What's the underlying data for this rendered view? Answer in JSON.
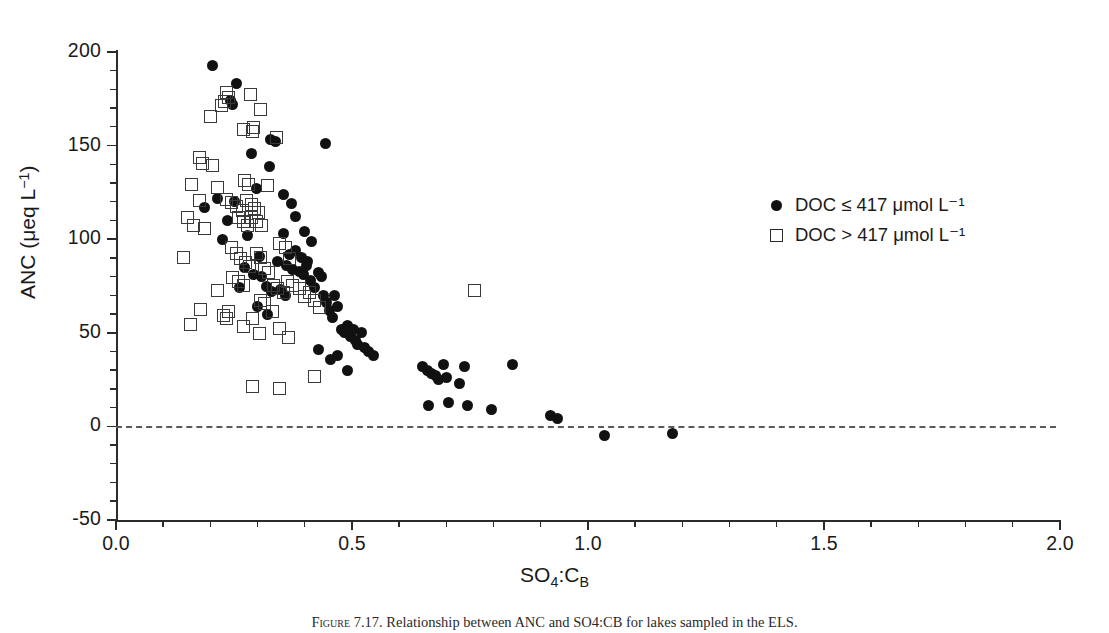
{
  "figure": {
    "caption_label": "Figure 7.17.",
    "caption_text": "Relationship between ANC and SO4:CB for lakes sampled in the ELS."
  },
  "axes": {
    "x": {
      "title_main": "SO",
      "title_sub": "4",
      "title_mid": ":C",
      "title_sub2": "B",
      "min": 0.0,
      "max": 2.0,
      "major_ticks": [
        0.0,
        0.5,
        1.0,
        1.5,
        2.0
      ],
      "tick_labels": [
        "0.0",
        "0.5",
        "1.0",
        "1.5",
        "2.0"
      ],
      "minor_step": 0.1
    },
    "y": {
      "title_main": "ANC (",
      "title_mu": "μ",
      "title_unit": "eq L",
      "title_sup": "−1",
      "title_end": ")",
      "min": -50,
      "max": 200,
      "major_ticks": [
        -50,
        0,
        50,
        100,
        150,
        200
      ],
      "tick_labels": [
        "-50",
        "0",
        "50",
        "100",
        "150",
        "200"
      ],
      "minor_step": 10
    }
  },
  "reference_line": {
    "value": 0,
    "style": "dashed"
  },
  "legend": {
    "items": [
      {
        "marker": "filled-circle",
        "text": "DOC ≤ 417 μmol L⁻¹"
      },
      {
        "marker": "open-square",
        "text": "DOC > 417 μmol L⁻¹"
      }
    ]
  },
  "chart_data": {
    "type": "scatter",
    "title": "Relationship between ANC and SO4:CB for lakes sampled in the ELS",
    "xlabel": "SO4:CB",
    "ylabel": "ANC (ueq L-1)",
    "xlim": [
      0.0,
      2.0
    ],
    "ylim": [
      -50,
      200
    ],
    "grid": false,
    "legend_position": "upper right",
    "reference_lines": [
      {
        "axis": "y",
        "value": 0,
        "style": "dashed"
      }
    ],
    "series": [
      {
        "name": "DOC ≤ 417 μmol L⁻¹",
        "marker": "filled-circle",
        "color": "#111111",
        "points": [
          [
            0.205,
            193
          ],
          [
            0.255,
            183
          ],
          [
            0.243,
            174
          ],
          [
            0.247,
            172
          ],
          [
            0.327,
            153
          ],
          [
            0.337,
            152
          ],
          [
            0.443,
            151
          ],
          [
            0.287,
            146
          ],
          [
            0.325,
            139
          ],
          [
            0.298,
            127
          ],
          [
            0.188,
            117
          ],
          [
            0.355,
            124
          ],
          [
            0.372,
            119
          ],
          [
            0.381,
            112
          ],
          [
            0.226,
            100
          ],
          [
            0.279,
            102
          ],
          [
            0.355,
            103
          ],
          [
            0.303,
            91
          ],
          [
            0.4,
            104
          ],
          [
            0.415,
            99
          ],
          [
            0.342,
            88
          ],
          [
            0.362,
            86
          ],
          [
            0.374,
            84
          ],
          [
            0.388,
            83
          ],
          [
            0.397,
            81
          ],
          [
            0.405,
            88
          ],
          [
            0.292,
            81
          ],
          [
            0.308,
            80
          ],
          [
            0.318,
            75
          ],
          [
            0.33,
            72
          ],
          [
            0.348,
            73
          ],
          [
            0.359,
            70
          ],
          [
            0.368,
            92
          ],
          [
            0.38,
            94
          ],
          [
            0.392,
            90
          ],
          [
            0.404,
            86
          ],
          [
            0.412,
            78
          ],
          [
            0.42,
            74
          ],
          [
            0.428,
            82
          ],
          [
            0.435,
            80
          ],
          [
            0.44,
            70
          ],
          [
            0.447,
            66
          ],
          [
            0.452,
            62
          ],
          [
            0.458,
            58
          ],
          [
            0.463,
            70
          ],
          [
            0.47,
            64
          ],
          [
            0.478,
            52
          ],
          [
            0.484,
            50
          ],
          [
            0.49,
            54
          ],
          [
            0.497,
            48
          ],
          [
            0.503,
            52
          ],
          [
            0.508,
            46
          ],
          [
            0.512,
            44
          ],
          [
            0.52,
            50
          ],
          [
            0.527,
            42
          ],
          [
            0.535,
            40
          ],
          [
            0.49,
            30
          ],
          [
            0.3,
            64
          ],
          [
            0.322,
            60
          ],
          [
            0.272,
            85
          ],
          [
            0.262,
            74
          ],
          [
            0.237,
            110
          ],
          [
            0.214,
            122
          ],
          [
            0.25,
            120
          ],
          [
            0.43,
            41
          ],
          [
            0.455,
            36
          ],
          [
            0.47,
            38
          ],
          [
            0.545,
            38
          ],
          [
            0.65,
            32
          ],
          [
            0.66,
            30
          ],
          [
            0.668,
            28
          ],
          [
            0.676,
            27
          ],
          [
            0.683,
            25
          ],
          [
            0.693,
            33
          ],
          [
            0.7,
            26
          ],
          [
            0.728,
            23
          ],
          [
            0.738,
            32
          ],
          [
            0.662,
            11
          ],
          [
            0.705,
            13
          ],
          [
            0.745,
            11
          ],
          [
            0.84,
            33
          ],
          [
            0.795,
            9
          ],
          [
            0.92,
            6
          ],
          [
            0.935,
            4
          ],
          [
            1.035,
            -5
          ],
          [
            1.18,
            -4
          ]
        ]
      },
      {
        "name": "DOC > 417 μmol L⁻¹",
        "marker": "open-square",
        "color": "#3a3a3a",
        "points": [
          [
            0.232,
            179
          ],
          [
            0.282,
            178
          ],
          [
            0.228,
            174
          ],
          [
            0.237,
            176
          ],
          [
            0.222,
            172
          ],
          [
            0.305,
            170
          ],
          [
            0.198,
            166
          ],
          [
            0.268,
            159
          ],
          [
            0.287,
            158
          ],
          [
            0.29,
            160
          ],
          [
            0.337,
            155
          ],
          [
            0.174,
            144
          ],
          [
            0.182,
            141
          ],
          [
            0.203,
            140
          ],
          [
            0.157,
            130
          ],
          [
            0.212,
            128
          ],
          [
            0.271,
            132
          ],
          [
            0.278,
            130
          ],
          [
            0.319,
            129
          ],
          [
            0.175,
            121
          ],
          [
            0.232,
            122
          ],
          [
            0.242,
            120
          ],
          [
            0.253,
            118
          ],
          [
            0.265,
            116
          ],
          [
            0.275,
            121
          ],
          [
            0.285,
            119
          ],
          [
            0.292,
            117
          ],
          [
            0.299,
            115
          ],
          [
            0.258,
            112
          ],
          [
            0.268,
            110
          ],
          [
            0.276,
            108
          ],
          [
            0.286,
            112
          ],
          [
            0.296,
            110
          ],
          [
            0.306,
            108
          ],
          [
            0.15,
            112
          ],
          [
            0.163,
            108
          ],
          [
            0.186,
            106
          ],
          [
            0.141,
            91
          ],
          [
            0.243,
            96
          ],
          [
            0.253,
            93
          ],
          [
            0.262,
            90
          ],
          [
            0.272,
            88
          ],
          [
            0.281,
            86
          ],
          [
            0.295,
            93
          ],
          [
            0.305,
            91
          ],
          [
            0.313,
            85
          ],
          [
            0.322,
            83
          ],
          [
            0.244,
            80
          ],
          [
            0.258,
            78
          ],
          [
            0.267,
            76
          ],
          [
            0.212,
            73
          ],
          [
            0.345,
            98
          ],
          [
            0.358,
            96
          ],
          [
            0.366,
            90
          ],
          [
            0.332,
            76
          ],
          [
            0.34,
            74
          ],
          [
            0.352,
            72
          ],
          [
            0.362,
            78
          ],
          [
            0.372,
            76
          ],
          [
            0.386,
            74
          ],
          [
            0.398,
            70
          ],
          [
            0.407,
            72
          ],
          [
            0.418,
            68
          ],
          [
            0.428,
            64
          ],
          [
            0.303,
            68
          ],
          [
            0.313,
            66
          ],
          [
            0.33,
            62
          ],
          [
            0.177,
            63
          ],
          [
            0.226,
            60
          ],
          [
            0.232,
            58
          ],
          [
            0.236,
            62
          ],
          [
            0.287,
            58
          ],
          [
            0.267,
            54
          ],
          [
            0.302,
            50
          ],
          [
            0.345,
            53
          ],
          [
            0.363,
            48
          ],
          [
            0.155,
            55
          ],
          [
            0.288,
            22
          ],
          [
            0.345,
            21
          ],
          [
            0.418,
            27
          ],
          [
            0.757,
            73
          ]
        ]
      }
    ]
  }
}
